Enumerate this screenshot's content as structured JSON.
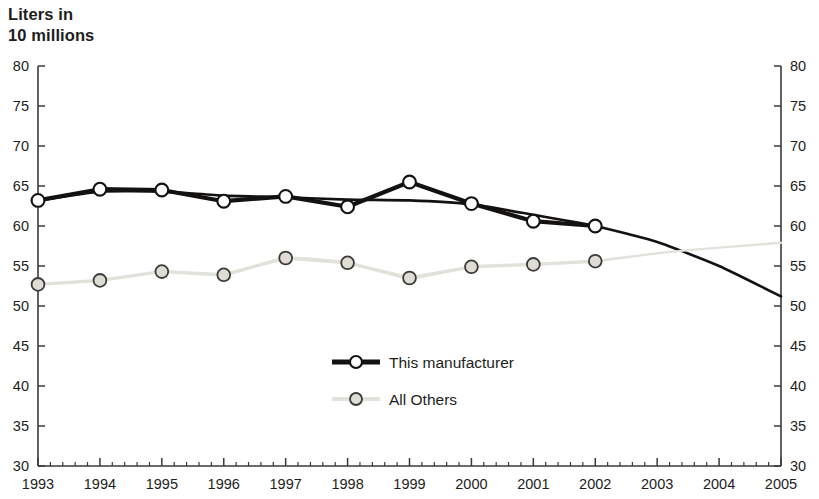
{
  "chart_data": {
    "type": "line",
    "title": "Liters in\n10 millions",
    "title_line1": "Liters in",
    "title_line2": "10 millions",
    "xlabel": "",
    "ylabel": "Liters in 10 millions",
    "x": [
      1993,
      1994,
      1995,
      1996,
      1997,
      1998,
      1999,
      2000,
      2001,
      2002,
      2003,
      2004,
      2005
    ],
    "xticklabels": [
      "1993",
      "1994",
      "1995",
      "1996",
      "1997",
      "1998",
      "1999",
      "2000",
      "2001",
      "2002",
      "2003",
      "2004",
      "2005"
    ],
    "yticklabels": [
      "30",
      "35",
      "40",
      "45",
      "50",
      "55",
      "60",
      "65",
      "70",
      "75",
      "80"
    ],
    "ylim": [
      30,
      80
    ],
    "xlim": [
      1993,
      2005
    ],
    "ytick_step": 5,
    "minor_xticks_per_interval": 4,
    "grid": false,
    "dual_y_axis": true,
    "legend_position": "center",
    "series": [
      {
        "name": "This manufacturer",
        "color": "#141210",
        "marker": "circle-open",
        "marker_fill": "#ffffff",
        "line_width": 4.2,
        "values": [
          63.2,
          64.6,
          64.5,
          63.1,
          63.7,
          62.4,
          65.5,
          62.8,
          60.6,
          60.0,
          null,
          null,
          null
        ],
        "marker_years": [
          1993,
          1994,
          1995,
          1996,
          1997,
          1998,
          1999,
          2000,
          2001,
          2002
        ],
        "trend_line": {
          "description": "smooth projected continuation without markers from 2002 to 2005",
          "x": [
            1993,
            1994,
            1995,
            1996,
            1997,
            1998,
            1999,
            2000,
            2001,
            2002,
            2003,
            2004,
            2005
          ],
          "y": [
            63.2,
            64.3,
            64.3,
            63.8,
            63.6,
            63.3,
            63.2,
            62.7,
            61.4,
            60.0,
            58.0,
            55.0,
            51.2
          ]
        }
      },
      {
        "name": "All Others",
        "color": "#e2e2dc",
        "marker": "circle-open",
        "marker_fill": "#dedcd4",
        "marker_stroke": "#3a3a38",
        "line_width": 3.4,
        "values": [
          52.7,
          53.2,
          54.3,
          53.9,
          56.0,
          55.4,
          53.5,
          54.9,
          55.2,
          55.6,
          null,
          null,
          null
        ],
        "marker_years": [
          1993,
          1994,
          1995,
          1996,
          1997,
          1998,
          1999,
          2000,
          2001,
          2002
        ],
        "trend_line": {
          "description": "smooth projected continuation without markers from 2002 to 2005",
          "x": [
            1993,
            1994,
            1995,
            1996,
            1997,
            1998,
            1999,
            2000,
            2001,
            2002,
            2003,
            2004,
            2005
          ],
          "y": [
            52.7,
            53.2,
            54.3,
            53.9,
            56.0,
            55.4,
            53.5,
            54.9,
            55.2,
            55.6,
            56.6,
            57.3,
            57.9
          ]
        }
      }
    ]
  },
  "legend": {
    "items": [
      {
        "label": "This manufacturer",
        "color": "#141210",
        "marker_fill": "#ffffff"
      },
      {
        "label": "All Others",
        "color": "#e2e2dc",
        "marker_fill": "#dedcd4"
      }
    ]
  },
  "colors": {
    "axis": "#3a3a38",
    "text": "#1d1d1b",
    "background": "#ffffff",
    "series_primary": "#141210",
    "series_secondary": "#e2e2dc"
  }
}
